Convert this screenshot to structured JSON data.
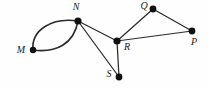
{
  "figure": {
    "background_color": "#fefefe",
    "stroke_color": "#2b2b2b",
    "vertex_color": "#111111",
    "label_color": "#1a1a1a",
    "width": 210,
    "height": 89
  },
  "chart_data": {
    "type": "diagram",
    "graph_kind": "undirected-multigraph",
    "title": "",
    "nodes": [
      {
        "id": "M",
        "label": "M",
        "x": 33,
        "y": 50,
        "r": 3.2,
        "label_x": 21,
        "label_y": 51,
        "label_anchor": "middle"
      },
      {
        "id": "N",
        "label": "N",
        "x": 78,
        "y": 21,
        "r": 3.6,
        "label_x": 76,
        "label_y": 8,
        "label_anchor": "middle"
      },
      {
        "id": "Q",
        "label": "Q",
        "x": 153,
        "y": 9,
        "r": 3.4,
        "label_x": 144,
        "label_y": 7,
        "label_anchor": "middle"
      },
      {
        "id": "R",
        "label": "R",
        "x": 117,
        "y": 41,
        "r": 3.6,
        "label_x": 127,
        "label_y": 48,
        "label_anchor": "middle"
      },
      {
        "id": "P",
        "label": "P",
        "x": 192,
        "y": 31,
        "r": 3.4,
        "label_x": 194,
        "label_y": 43,
        "label_anchor": "middle"
      },
      {
        "id": "S",
        "label": "S",
        "x": 119,
        "y": 77,
        "r": 3.4,
        "label_x": 109,
        "label_y": 75,
        "label_anchor": "middle"
      }
    ],
    "edges": [
      {
        "source": "M",
        "target": "N",
        "shape": "curve",
        "note": "upper parallel arc",
        "path": "M 33 50 C 31 30 52 17 78 21"
      },
      {
        "source": "M",
        "target": "N",
        "shape": "curve",
        "note": "lower parallel arc",
        "path": "M 33 50 C 56 53 74 44 78 21"
      },
      {
        "source": "N",
        "target": "R",
        "shape": "line",
        "path": "M 78 21 L 117 41"
      },
      {
        "source": "N",
        "target": "S",
        "shape": "line",
        "path": "M 78 21 L 119 77"
      },
      {
        "source": "R",
        "target": "S",
        "shape": "line",
        "path": "M 117 41 L 119 77"
      },
      {
        "source": "R",
        "target": "Q",
        "shape": "line",
        "path": "M 117 41 L 153 9"
      },
      {
        "source": "Q",
        "target": "P",
        "shape": "line",
        "path": "M 153 9 L 192 31"
      },
      {
        "source": "R",
        "target": "P",
        "shape": "line",
        "path": "M 117 41 L 192 31"
      }
    ],
    "node_count": 6,
    "edge_count": 8,
    "xlim": [
      0,
      210
    ],
    "ylim": [
      0,
      89
    ],
    "grid": false,
    "legend": null
  }
}
